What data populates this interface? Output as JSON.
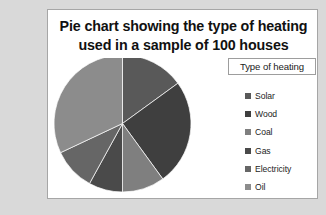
{
  "chart": {
    "title_line1": "Pie chart showing the type of heating",
    "title_line2": "used in a sample of 100 houses",
    "legend_title": "Type of heating",
    "frame_color": "#d9d9d9",
    "panel_color": "#ffffff",
    "panel_border_color": "#a6a6a6"
  },
  "chart_data": {
    "type": "pie",
    "title": "Pie chart showing the type of heating used in a sample of 100 houses",
    "legend_title": "Type of heating",
    "legend_position": "right",
    "grid": false,
    "total": 100,
    "units": "houses",
    "start_angle_deg": 0,
    "direction": "clockwise",
    "categories": [
      "Solar",
      "Wood",
      "Coal",
      "Gas",
      "Electricity",
      "Oil"
    ],
    "values": [
      15,
      25,
      10,
      8,
      10,
      32
    ],
    "colors": [
      "#595959",
      "#3f3f3f",
      "#7f7f7f",
      "#4a4a4a",
      "#666666",
      "#8c8c8c"
    ],
    "slices": [
      {
        "label": "Solar",
        "value": 15,
        "color": "#595959",
        "start_deg": 0,
        "end_deg": 54
      },
      {
        "label": "Wood",
        "value": 25,
        "color": "#3f3f3f",
        "start_deg": 54,
        "end_deg": 144
      },
      {
        "label": "Coal",
        "value": 10,
        "color": "#7f7f7f",
        "start_deg": 144,
        "end_deg": 180
      },
      {
        "label": "Gas",
        "value": 8,
        "color": "#4a4a4a",
        "start_deg": 180,
        "end_deg": 208.8
      },
      {
        "label": "Electricity",
        "value": 10,
        "color": "#666666",
        "start_deg": 208.8,
        "end_deg": 244.8
      },
      {
        "label": "Oil",
        "value": 32,
        "color": "#8c8c8c",
        "start_deg": 244.8,
        "end_deg": 360
      }
    ]
  }
}
